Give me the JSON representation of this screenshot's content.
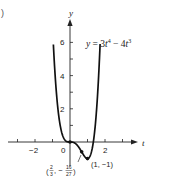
{
  "panel_marker": ")",
  "chart_data": {
    "type": "line",
    "title": "",
    "equation_label": "y = 3t^4 − 4t^3",
    "equation_parts": {
      "lhs": "y",
      "eq": " = 3",
      "t1": "t",
      "e1": "4",
      "minus": " − 4",
      "t2": "t",
      "e2": "3"
    },
    "xlabel": "t",
    "ylabel": "y",
    "xlim": [
      -3.5,
      3.8
    ],
    "ylim": [
      -1.3,
      7.3
    ],
    "x_ticks": [
      -3,
      -2,
      -1,
      0,
      1,
      2,
      3
    ],
    "x_tick_labels": {
      "-2": "−2",
      "0": "0",
      "2": "2"
    },
    "y_ticks": [
      1,
      2,
      3,
      4,
      5,
      6
    ],
    "y_tick_labels": {
      "2": "2",
      "4": "4",
      "6": "6"
    },
    "grid": false,
    "series": [
      {
        "name": "y = 3t^4 − 4t^3",
        "function": "3*t^4 - 4*t^3",
        "t_range": [
          -0.95,
          1.72
        ]
      }
    ],
    "annotations": [
      {
        "point": [
          0,
          0
        ],
        "label": ""
      },
      {
        "point": [
          0.6667,
          -0.5926
        ],
        "label": "(2/3, −16/27)",
        "label_parts": {
          "open": "(",
          "n1": "2",
          "d1": "3",
          "sep": ", −",
          "n2": "16",
          "d2": "27",
          "close": ")"
        }
      },
      {
        "point": [
          1,
          -1
        ],
        "label": "(1, −1)"
      }
    ]
  }
}
